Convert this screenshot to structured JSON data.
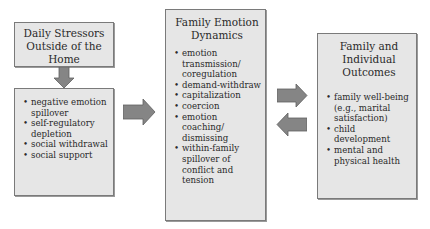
{
  "stressors_box": {
    "title_lines": [
      "Daily Stressors",
      "Outside of the",
      "Home"
    ]
  },
  "processes_box": {
    "items": [
      "negative emotion spillover",
      "self-regulatory depletion",
      "social withdrawal",
      "social support"
    ]
  },
  "dynamics_box": {
    "title_lines": [
      "Family Emotion",
      "Dynamics"
    ],
    "items": [
      "emotion transmission/ coregulation",
      "demand-withdraw",
      "capitalization",
      "coercion",
      "emotion coaching/ dismissing",
      "within-family spillover of conflict and tension"
    ]
  },
  "outcomes_box": {
    "title_lines": [
      "Family and",
      "Individual",
      "Outcomes"
    ],
    "items": [
      "family well-being (e.g., marital satisfaction)",
      "child development",
      "mental and physical health"
    ]
  },
  "colors": {
    "box_fill": "#e6e6e6",
    "box_border": "#7a7a7a",
    "arrow_fill": "#858585",
    "arrow_stroke": "#5f5f5f"
  }
}
